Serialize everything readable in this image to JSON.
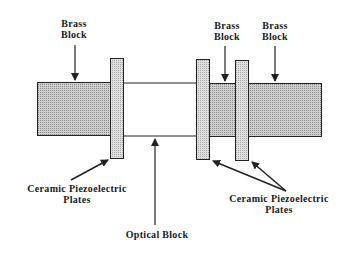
{
  "diagram": {
    "colors": {
      "outline": "#222222",
      "brass_fill": "#b8b8b8",
      "plate_fill": "#d6d6d6",
      "background": "#ffffff"
    },
    "labels": {
      "brass_block_left": {
        "line1": "Brass",
        "line2": "Block"
      },
      "brass_block_mid": {
        "line1": "Brass",
        "line2": "Block"
      },
      "brass_block_right": {
        "line1": "Brass",
        "line2": "Block"
      },
      "ceramic_left": {
        "line1": "Ceramic  Piezoelectric",
        "line2": "Plates"
      },
      "ceramic_right": {
        "line1": "Ceramic  Piezoelectric",
        "line2": "Plates"
      },
      "optical_block": {
        "line1": "Optical  Block"
      }
    }
  }
}
